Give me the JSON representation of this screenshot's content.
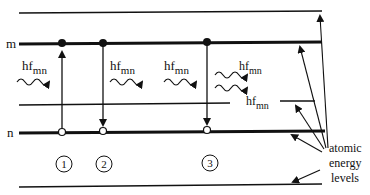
{
  "diagram": {
    "level_labels": {
      "upper": "m",
      "lower": "n"
    },
    "photon_label": {
      "main": "hf",
      "sub": "mn"
    },
    "processes": [
      {
        "id": "1",
        "label": "1",
        "type": "absorption"
      },
      {
        "id": "2",
        "label": "2",
        "type": "spontaneous emission"
      },
      {
        "id": "3",
        "label": "3",
        "type": "stimulated emission"
      }
    ],
    "annotation": {
      "line1": "atomic",
      "line2": "energy",
      "line3": "levels"
    },
    "colors": {
      "ink": "#111111",
      "background": "#ffffff"
    }
  }
}
